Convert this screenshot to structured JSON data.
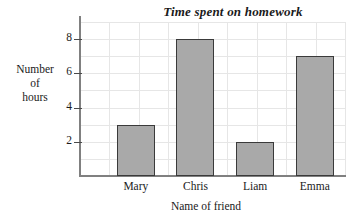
{
  "chart_data": {
    "type": "bar",
    "title": "Time spent on homework",
    "xlabel": "Name of friend",
    "ylabel": "Number of hours",
    "ylabel_lines": [
      "Number",
      "of",
      "hours"
    ],
    "categories": [
      "Mary",
      "Chris",
      "Liam",
      "Emma"
    ],
    "values": [
      3,
      8,
      2,
      7
    ],
    "ylim": [
      0,
      9
    ],
    "yticks": [
      2,
      4,
      6,
      8
    ],
    "ytick_labels": [
      "2",
      "4",
      "6",
      "8"
    ],
    "grid": true,
    "legend": null,
    "bar_fill_color": "#a9a9a9",
    "bar_edge_color": "#3a3a3a",
    "axis_color": "#808080",
    "grid_color": "#e6e6e6",
    "background_color": "#ffffff"
  }
}
